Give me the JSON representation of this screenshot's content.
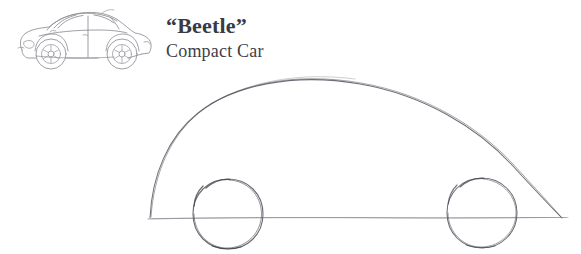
{
  "page": {
    "background_color": "#ffffff",
    "width": 581,
    "height": 254
  },
  "caption": {
    "title": "“Beetle”",
    "subtitle": "Compact Car",
    "title_color": "#3a3a42",
    "subtitle_color": "#3f3f46"
  },
  "reference_illustration": {
    "name": "vw-beetle-side-view-line-drawing",
    "description": "Line drawing of a Volkswagen New Beetle in left-facing side profile",
    "stroke_color": "#8a8a93",
    "facing": "left",
    "wheels": 2
  },
  "sketch": {
    "name": "pencil-construction-sketch",
    "description": "Pencil construction drawing of a car: one large dome arch for the body, a horizontal ground line, and two circles for the wheels",
    "graphite_color": "#6e6e78",
    "graphite_dark_color": "#4a4a53",
    "ground_line_color": "#8e8e96",
    "dome": {
      "label": "body-dome-arch",
      "left_end": [
        150,
        218
      ],
      "apex": [
        360,
        84
      ],
      "right_end": [
        562,
        218
      ]
    },
    "ground_line": {
      "label": "ground-line",
      "start": [
        148,
        219
      ],
      "end": [
        568,
        217
      ]
    },
    "wheels": [
      {
        "label": "front-wheel-circle",
        "center": [
          228,
          214
        ],
        "radius": 35
      },
      {
        "label": "rear-wheel-circle",
        "center": [
          482,
          213
        ],
        "radius": 35
      }
    ]
  }
}
